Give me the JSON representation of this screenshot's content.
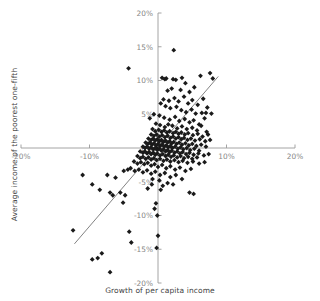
{
  "chart_data": {
    "type": "scatter",
    "title": "",
    "xlabel": "Growth of per capita income",
    "ylabel": "Average income of the poorest one-fifth",
    "xlim": [
      -20,
      20
    ],
    "ylim": [
      -20,
      20
    ],
    "xticks": [
      -20,
      -10,
      0,
      10,
      20
    ],
    "yticks": [
      -20,
      -15,
      -10,
      -5,
      0,
      5,
      10,
      15,
      20
    ],
    "xtick_labels": [
      "-20%",
      "-10%",
      "",
      "10%",
      "20%"
    ],
    "ytick_labels": [
      "-20%",
      "-15%",
      "-10%",
      "-5%",
      "0%",
      "5%",
      "10%",
      "15%",
      "20%"
    ],
    "grid": false,
    "legend": false,
    "axes_cross_at_origin": true,
    "point_color": "#1a1a1a",
    "point_marker": "diamond",
    "point_size": 2.4,
    "trendline": {
      "visible": true,
      "color": "#6b6b6b",
      "x_start": -12.2,
      "y_start": -14.2,
      "x_end": 8.8,
      "y_end": 10.6
    },
    "series": [
      {
        "name": "Countries",
        "points": [
          [
            -4.3,
            11.8
          ],
          [
            2.3,
            14.5
          ],
          [
            -0.2,
            0.0
          ],
          [
            0.6,
            10.4
          ],
          [
            1.0,
            10.2
          ],
          [
            1.2,
            10.3
          ],
          [
            2.2,
            10.2
          ],
          [
            2.6,
            10.1
          ],
          [
            3.5,
            10.4
          ],
          [
            4.0,
            9.6
          ],
          [
            6.2,
            10.7
          ],
          [
            7.6,
            11.1
          ],
          [
            8.0,
            10.3
          ],
          [
            5.3,
            9.0
          ],
          [
            4.6,
            8.3
          ],
          [
            3.3,
            8.6
          ],
          [
            2.0,
            8.8
          ],
          [
            1.4,
            8.5
          ],
          [
            0.8,
            7.2
          ],
          [
            1.6,
            7.0
          ],
          [
            2.4,
            7.4
          ],
          [
            3.0,
            6.9
          ],
          [
            3.8,
            7.6
          ],
          [
            4.4,
            6.6
          ],
          [
            5.0,
            7.1
          ],
          [
            5.8,
            6.4
          ],
          [
            6.6,
            7.3
          ],
          [
            7.2,
            6.0
          ],
          [
            0.4,
            6.6
          ],
          [
            1.1,
            6.2
          ],
          [
            1.8,
            5.9
          ],
          [
            2.7,
            6.1
          ],
          [
            3.4,
            5.6
          ],
          [
            4.1,
            5.3
          ],
          [
            4.9,
            5.7
          ],
          [
            5.5,
            5.1
          ],
          [
            6.4,
            5.2
          ],
          [
            7.0,
            5.2
          ],
          [
            7.8,
            5.1
          ],
          [
            -0.6,
            5.0
          ],
          [
            -1.2,
            4.4
          ],
          [
            0.2,
            4.8
          ],
          [
            0.9,
            4.5
          ],
          [
            1.7,
            4.2
          ],
          [
            2.5,
            4.6
          ],
          [
            3.1,
            4.0
          ],
          [
            3.9,
            4.3
          ],
          [
            4.6,
            3.8
          ],
          [
            5.2,
            4.1
          ],
          [
            6.0,
            3.5
          ],
          [
            6.8,
            4.4
          ],
          [
            -0.3,
            3.6
          ],
          [
            0.3,
            3.4
          ],
          [
            1.0,
            3.1
          ],
          [
            1.5,
            3.5
          ],
          [
            2.1,
            3.3
          ],
          [
            2.8,
            2.9
          ],
          [
            3.5,
            3.2
          ],
          [
            4.2,
            2.8
          ],
          [
            5.0,
            3.0
          ],
          [
            5.7,
            2.6
          ],
          [
            6.3,
            3.3
          ],
          [
            7.1,
            2.4
          ],
          [
            -0.8,
            2.8
          ],
          [
            -0.4,
            2.5
          ],
          [
            0.1,
            2.7
          ],
          [
            0.5,
            2.4
          ],
          [
            0.9,
            2.6
          ],
          [
            1.3,
            2.3
          ],
          [
            1.7,
            2.5
          ],
          [
            2.2,
            2.2
          ],
          [
            2.6,
            2.4
          ],
          [
            3.0,
            2.1
          ],
          [
            3.4,
            2.3
          ],
          [
            3.9,
            2.0
          ],
          [
            4.4,
            2.2
          ],
          [
            5.1,
            1.9
          ],
          [
            5.8,
            2.1
          ],
          [
            6.5,
            1.7
          ],
          [
            7.3,
            2.0
          ],
          [
            -1.0,
            2.0
          ],
          [
            -0.6,
            1.8
          ],
          [
            -0.2,
            2.0
          ],
          [
            0.2,
            1.7
          ],
          [
            0.6,
            1.9
          ],
          [
            1.0,
            1.6
          ],
          [
            1.4,
            1.8
          ],
          [
            1.8,
            1.5
          ],
          [
            2.2,
            1.7
          ],
          [
            2.6,
            1.4
          ],
          [
            3.0,
            1.6
          ],
          [
            3.4,
            1.3
          ],
          [
            3.8,
            1.5
          ],
          [
            4.3,
            1.2
          ],
          [
            4.8,
            1.4
          ],
          [
            5.4,
            1.1
          ],
          [
            6.1,
            1.3
          ],
          [
            6.9,
            1.0
          ],
          [
            7.6,
            1.2
          ],
          [
            -1.4,
            1.4
          ],
          [
            -1.0,
            1.2
          ],
          [
            -0.7,
            1.4
          ],
          [
            -0.4,
            1.1
          ],
          [
            -0.1,
            1.3
          ],
          [
            0.2,
            1.0
          ],
          [
            0.5,
            1.2
          ],
          [
            0.8,
            0.9
          ],
          [
            1.1,
            1.1
          ],
          [
            1.4,
            0.8
          ],
          [
            1.7,
            1.0
          ],
          [
            2.0,
            0.7
          ],
          [
            2.3,
            0.9
          ],
          [
            2.7,
            0.6
          ],
          [
            3.1,
            0.8
          ],
          [
            3.5,
            0.5
          ],
          [
            4.0,
            0.7
          ],
          [
            4.5,
            0.4
          ],
          [
            5.0,
            0.6
          ],
          [
            5.6,
            0.3
          ],
          [
            6.3,
            0.5
          ],
          [
            7.0,
            0.2
          ],
          [
            -1.8,
            0.8
          ],
          [
            -1.5,
            0.6
          ],
          [
            -1.2,
            0.8
          ],
          [
            -0.9,
            0.5
          ],
          [
            -0.6,
            0.7
          ],
          [
            -0.3,
            0.4
          ],
          [
            0.0,
            0.6
          ],
          [
            0.3,
            0.3
          ],
          [
            0.6,
            0.5
          ],
          [
            0.9,
            0.2
          ],
          [
            1.2,
            0.4
          ],
          [
            1.5,
            0.1
          ],
          [
            1.8,
            0.3
          ],
          [
            2.1,
            0.0
          ],
          [
            2.5,
            0.2
          ],
          [
            2.9,
            -0.1
          ],
          [
            3.3,
            0.1
          ],
          [
            3.7,
            -0.2
          ],
          [
            4.2,
            0.0
          ],
          [
            4.7,
            -0.3
          ],
          [
            5.3,
            -0.1
          ],
          [
            6.0,
            -0.4
          ],
          [
            -2.2,
            0.2
          ],
          [
            -1.9,
            0.0
          ],
          [
            -1.6,
            0.2
          ],
          [
            -1.3,
            -0.1
          ],
          [
            -1.0,
            0.1
          ],
          [
            -0.7,
            -0.2
          ],
          [
            -0.4,
            0.0
          ],
          [
            -0.1,
            -0.3
          ],
          [
            0.2,
            -0.1
          ],
          [
            0.5,
            -0.4
          ],
          [
            0.8,
            -0.2
          ],
          [
            1.1,
            -0.5
          ],
          [
            1.4,
            -0.3
          ],
          [
            1.7,
            -0.6
          ],
          [
            2.0,
            -0.4
          ],
          [
            2.4,
            -0.7
          ],
          [
            2.8,
            -0.5
          ],
          [
            3.2,
            -0.8
          ],
          [
            3.6,
            -0.6
          ],
          [
            4.1,
            -0.9
          ],
          [
            4.6,
            -0.7
          ],
          [
            5.2,
            -1.0
          ],
          [
            5.9,
            -0.8
          ],
          [
            6.7,
            -1.1
          ],
          [
            7.4,
            -0.9
          ],
          [
            -2.6,
            -0.5
          ],
          [
            -2.2,
            -0.7
          ],
          [
            -1.9,
            -0.5
          ],
          [
            -1.6,
            -0.8
          ],
          [
            -1.3,
            -0.6
          ],
          [
            -1.0,
            -0.9
          ],
          [
            -0.7,
            -0.7
          ],
          [
            -0.4,
            -1.0
          ],
          [
            -0.1,
            -0.8
          ],
          [
            0.3,
            -1.1
          ],
          [
            0.7,
            -0.9
          ],
          [
            1.1,
            -1.2
          ],
          [
            1.5,
            -1.0
          ],
          [
            1.9,
            -1.3
          ],
          [
            2.3,
            -1.1
          ],
          [
            2.8,
            -1.4
          ],
          [
            3.3,
            -1.2
          ],
          [
            3.8,
            -1.5
          ],
          [
            4.4,
            -1.3
          ],
          [
            5.0,
            -1.6
          ],
          [
            5.7,
            -1.4
          ],
          [
            -3.0,
            -1.2
          ],
          [
            -2.6,
            -1.5
          ],
          [
            -2.2,
            -1.3
          ],
          [
            -1.8,
            -1.6
          ],
          [
            -1.4,
            -1.4
          ],
          [
            -1.0,
            -1.7
          ],
          [
            -0.6,
            -1.5
          ],
          [
            -0.2,
            -1.8
          ],
          [
            0.3,
            -1.6
          ],
          [
            0.8,
            -1.9
          ],
          [
            1.3,
            -1.7
          ],
          [
            1.8,
            -2.0
          ],
          [
            2.4,
            -1.8
          ],
          [
            3.0,
            -2.1
          ],
          [
            3.6,
            -1.9
          ],
          [
            4.3,
            -2.2
          ],
          [
            5.1,
            -2.0
          ],
          [
            6.0,
            -2.3
          ],
          [
            6.8,
            -2.1
          ],
          [
            -3.5,
            -2.0
          ],
          [
            -3.0,
            -2.3
          ],
          [
            -2.5,
            -2.1
          ],
          [
            -2.0,
            -2.4
          ],
          [
            -1.5,
            -2.2
          ],
          [
            -1.0,
            -2.6
          ],
          [
            -0.5,
            -2.4
          ],
          [
            0.0,
            -2.8
          ],
          [
            0.6,
            -2.5
          ],
          [
            1.2,
            -3.0
          ],
          [
            1.8,
            -2.7
          ],
          [
            2.5,
            -3.2
          ],
          [
            3.2,
            -2.9
          ],
          [
            4.0,
            -3.4
          ],
          [
            4.8,
            -3.1
          ],
          [
            -4.0,
            -3.0
          ],
          [
            -3.4,
            -3.4
          ],
          [
            -2.8,
            -3.2
          ],
          [
            -2.2,
            -3.6
          ],
          [
            -1.6,
            -3.3
          ],
          [
            -1.0,
            -3.8
          ],
          [
            -0.4,
            -3.5
          ],
          [
            0.3,
            -4.0
          ],
          [
            1.0,
            -3.7
          ],
          [
            1.8,
            -4.3
          ],
          [
            2.6,
            -4.0
          ],
          [
            3.5,
            -4.6
          ],
          [
            -0.8,
            -4.6
          ],
          [
            0.2,
            -4.8
          ],
          [
            1.4,
            -5.2
          ],
          [
            -0.9,
            -5.4
          ],
          [
            0.7,
            -5.6
          ],
          [
            2.2,
            -5.4
          ],
          [
            -1.5,
            -6.0
          ],
          [
            0.4,
            -6.2
          ],
          [
            4.6,
            -6.6
          ],
          [
            5.2,
            -6.8
          ],
          [
            -5.5,
            -6.6
          ],
          [
            -6.6,
            -7.0
          ],
          [
            -7.0,
            -6.6
          ],
          [
            -4.8,
            -7.0
          ],
          [
            -5.1,
            -8.1
          ],
          [
            -0.3,
            -8.2
          ],
          [
            -8.5,
            -6.2
          ],
          [
            -9.6,
            -5.4
          ],
          [
            -11.0,
            -4.0
          ],
          [
            -6.2,
            -4.4
          ],
          [
            -7.4,
            -4.0
          ],
          [
            -5.0,
            -3.4
          ],
          [
            -4.4,
            -3.2
          ],
          [
            -12.4,
            -12.2
          ],
          [
            -4.2,
            -12.4
          ],
          [
            -3.9,
            -14.0
          ],
          [
            -9.6,
            -16.5
          ],
          [
            -8.8,
            -16.3
          ],
          [
            -8.2,
            -15.6
          ],
          [
            -7.0,
            -18.4
          ],
          [
            -0.5,
            -9.0
          ],
          [
            -0.1,
            -10.0
          ],
          [
            -0.2,
            -14.8
          ],
          [
            0.0,
            -13.0
          ]
        ]
      }
    ]
  }
}
